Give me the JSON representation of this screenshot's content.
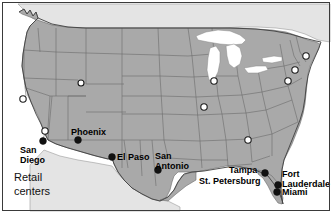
{
  "figure": {
    "caption": "Retail\ncenters",
    "frame_color": "#3a3a3a",
    "background_color": "#ffffff"
  },
  "map": {
    "region": "Contiguous United States",
    "land_fill_color": "#a9a9a9",
    "state_border_color": "#6b6b6b",
    "coast_outline_color": "#404040",
    "lake_fill_color": "#ffffff",
    "neighbor_fill_color": "#e4e4e4"
  },
  "legend": {
    "filled_marker_meaning": "Labeled retail center",
    "open_marker_meaning": "Unlabeled retail center",
    "filled_marker_color": "#111111",
    "open_marker_color": "#ffffff"
  },
  "labeled_markers": [
    {
      "name": "San Diego",
      "label": "San\nDiego",
      "x": 43,
      "y": 141,
      "label_x": 20,
      "label_y": 145,
      "align": "left"
    },
    {
      "name": "Phoenix",
      "label": "Phoenix",
      "x": 78,
      "y": 140,
      "label_x": 71,
      "label_y": 128,
      "align": "left"
    },
    {
      "name": "El Paso",
      "label": "El Paso",
      "x": 112,
      "y": 157,
      "label_x": 117,
      "label_y": 152,
      "align": "left"
    },
    {
      "name": "San Antonio",
      "label": "San\nAntonio",
      "x": 158,
      "y": 170,
      "label_x": 155,
      "label_y": 152,
      "align": "left"
    },
    {
      "name": "Tampa",
      "label": "Tampa",
      "x": 265,
      "y": 173,
      "label_x": 230,
      "label_y": 167,
      "align": "left"
    },
    {
      "name": "St. Petersburg",
      "label": "St. Petersburg",
      "x": 265,
      "y": 173,
      "label_x": 200,
      "label_y": 177,
      "align": "left"
    },
    {
      "name": "Fort Lauderdale",
      "label": "Fort\nLauderdale",
      "x": 278,
      "y": 185,
      "label_x": 282,
      "label_y": 170,
      "align": "left"
    },
    {
      "name": "Miami",
      "label": "Miami",
      "x": 277,
      "y": 192,
      "label_x": 282,
      "label_y": 188,
      "align": "left"
    }
  ],
  "open_markers": [
    {
      "name": "San Francisco",
      "x": 23,
      "y": 99
    },
    {
      "name": "Los Angeles",
      "x": 45,
      "y": 131
    },
    {
      "name": "Salt Lake City",
      "x": 81,
      "y": 83
    },
    {
      "name": "Chicago",
      "x": 214,
      "y": 81
    },
    {
      "name": "St. Louis",
      "x": 204,
      "y": 107
    },
    {
      "name": "Atlanta",
      "x": 248,
      "y": 140
    },
    {
      "name": "Boston",
      "x": 306,
      "y": 56
    },
    {
      "name": "New York",
      "x": 295,
      "y": 70
    },
    {
      "name": "Philadelphia",
      "x": 288,
      "y": 81
    }
  ]
}
